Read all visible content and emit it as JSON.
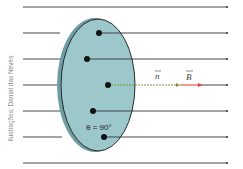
{
  "diagram": {
    "credit": "Ilustrações: Danial das Neves",
    "angle_label": "θ = 90°",
    "normal_label": "n",
    "field_label": "B",
    "colors": {
      "surface_fill": "#9cc8cc",
      "surface_edge": "#6e9ea3",
      "field_lines": "#333333",
      "normal_vector": "#7a9a3a",
      "field_vector": "#e03a2a"
    },
    "field_line_count": 7
  }
}
